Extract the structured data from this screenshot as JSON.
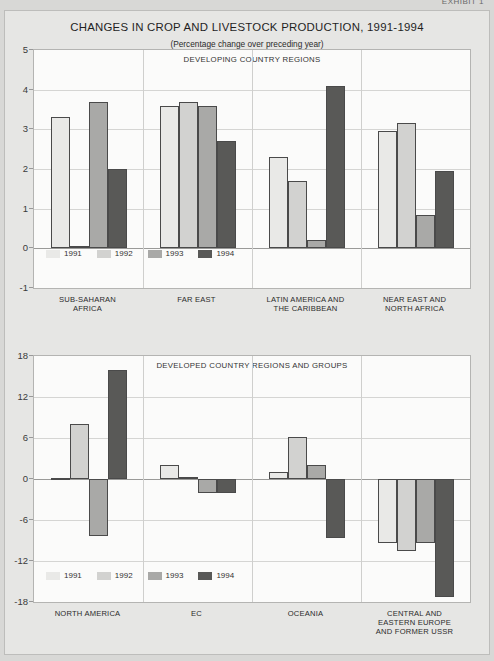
{
  "exhibit_tag": "EXHIBIT 1",
  "title": "CHANGES IN CROP AND LIVESTOCK PRODUCTION, 1991-1994",
  "subtitle": "(Percentage change over preceding year)",
  "legend": {
    "items": [
      {
        "label": "1991",
        "color": "#e9e9e7"
      },
      {
        "label": "1992",
        "color": "#d2d2d0"
      },
      {
        "label": "1993",
        "color": "#a9a9a7"
      },
      {
        "label": "1994",
        "color": "#595957"
      }
    ]
  },
  "chart_data": [
    {
      "type": "bar",
      "title": "DEVELOPING COUNTRY REGIONS",
      "chart_title": "CHANGES IN CROP AND LIVESTOCK PRODUCTION, 1991-1994",
      "subtitle": "(Percentage change over preceding year)",
      "xlabel": "",
      "ylabel": "",
      "ylim": [
        -1,
        5
      ],
      "yticks": [
        5,
        4,
        3,
        2,
        1,
        0,
        -1
      ],
      "grid": true,
      "legend_position": "bottom-left",
      "categories": [
        "SUB-SAHARAN\nAFRICA",
        "FAR EAST",
        "LATIN AMERICA AND\nTHE CARIBBEAN",
        "NEAR EAST AND\nNORTH AFRICA"
      ],
      "series": [
        {
          "name": "1991",
          "color": "#e9e9e7",
          "values": [
            3.3,
            3.6,
            2.3,
            2.95
          ]
        },
        {
          "name": "1992",
          "color": "#d2d2d0",
          "values": [
            0.05,
            3.7,
            1.7,
            3.15
          ]
        },
        {
          "name": "1993",
          "color": "#a9a9a7",
          "values": [
            3.7,
            3.6,
            0.2,
            0.85
          ]
        },
        {
          "name": "1994",
          "color": "#595957",
          "values": [
            2.0,
            2.7,
            4.1,
            1.95
          ]
        }
      ]
    },
    {
      "type": "bar",
      "title": "DEVELOPED COUNTRY REGIONS AND GROUPS",
      "xlabel": "",
      "ylabel": "",
      "ylim": [
        -18,
        18
      ],
      "yticks": [
        18,
        12,
        6,
        0,
        -6,
        -12,
        -18
      ],
      "grid": true,
      "legend_position": "bottom-left",
      "categories": [
        "NORTH AMERICA",
        "EC",
        "OCEANIA",
        "CENTRAL AND\nEASTERN EUROPE\nAND FORMER USSR"
      ],
      "series": [
        {
          "name": "1991",
          "color": "#e9e9e7",
          "values": [
            0.2,
            2.0,
            1.0,
            -9.3
          ]
        },
        {
          "name": "1992",
          "color": "#d2d2d0",
          "values": [
            8.0,
            0.3,
            6.1,
            -10.5
          ]
        },
        {
          "name": "1993",
          "color": "#a9a9a7",
          "values": [
            -8.3,
            -2.1,
            2.0,
            -9.3
          ]
        },
        {
          "name": "1994",
          "color": "#595957",
          "values": [
            16.0,
            -2.1,
            -8.6,
            -17.3
          ]
        }
      ]
    }
  ]
}
